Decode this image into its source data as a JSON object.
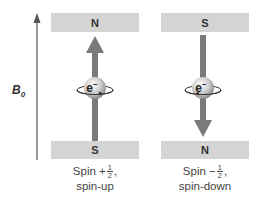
{
  "diagram": {
    "field_label": "B",
    "field_label_subscript": "0",
    "colors": {
      "magnet_bar": "#d4d4d4",
      "spin_arrow": "#7a7a7a",
      "field_arrow": "#555555",
      "electron_sphere_light": "#f4f4f4",
      "electron_sphere_dark": "#9a9a9a",
      "text": "#333333"
    },
    "panels": [
      {
        "id": "spin-up",
        "top_pole": "N",
        "bottom_pole": "S",
        "electron_label": "e",
        "electron_charge": "−",
        "arrow_direction": "up",
        "caption_prefix": "Spin +",
        "caption_frac_num": "1",
        "caption_frac_den": "2",
        "caption_suffix": ",",
        "caption_line2": "spin-up"
      },
      {
        "id": "spin-down",
        "top_pole": "S",
        "bottom_pole": "N",
        "electron_label": "e",
        "electron_charge": "−",
        "arrow_direction": "down",
        "caption_prefix": "Spin −",
        "caption_frac_num": "1",
        "caption_frac_den": "2",
        "caption_suffix": ",",
        "caption_line2": "spin-down"
      }
    ]
  }
}
